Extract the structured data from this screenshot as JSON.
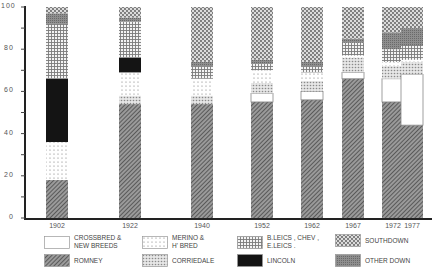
{
  "chart_data": {
    "type": "bar",
    "stacked": true,
    "title": "",
    "xlabel": "",
    "ylabel": "",
    "ylim": [
      0,
      100
    ],
    "yticks": [
      0,
      20,
      40,
      60,
      80,
      100
    ],
    "grid": false,
    "legend_position": "bottom",
    "categories": [
      "1902",
      "1922",
      "1940",
      "1952",
      "1962",
      "1967",
      "1972",
      "1977"
    ],
    "series": [
      {
        "name": "Romney",
        "pattern": "romney",
        "values": [
          18,
          54,
          54,
          55,
          56,
          66,
          55,
          44
        ]
      },
      {
        "name": "Crossbred & New Breeds",
        "pattern": "crossbred",
        "values": [
          0,
          0,
          0,
          4,
          4,
          3,
          11,
          24
        ]
      },
      {
        "name": "Corriedale",
        "pattern": "corriedale",
        "values": [
          0,
          4,
          4,
          5,
          5,
          7,
          6,
          6
        ]
      },
      {
        "name": "Merino & H' Bred",
        "pattern": "merino",
        "values": [
          18,
          11,
          8,
          6,
          4,
          1,
          2,
          1
        ]
      },
      {
        "name": "Lincoln",
        "pattern": "lincoln",
        "values": [
          30,
          7,
          0,
          0,
          0,
          0,
          0,
          0
        ]
      },
      {
        "name": "B.Leics, Chev, E.Leics.",
        "pattern": "leics",
        "values": [
          26,
          17,
          6,
          3,
          3,
          6,
          6,
          7
        ]
      },
      {
        "name": "Other Down",
        "pattern": "otherdown",
        "values": [
          5,
          2,
          2,
          2,
          2,
          2,
          8,
          8
        ]
      },
      {
        "name": "Southdown",
        "pattern": "southdown",
        "values": [
          3,
          5,
          26,
          25,
          26,
          15,
          12,
          10
        ]
      }
    ]
  },
  "axis": {
    "y_labels": [
      "0",
      "20",
      "40",
      "60",
      "80",
      "100"
    ],
    "x_labels": [
      "1902",
      "1922",
      "1940",
      "1952",
      "1962",
      "1967",
      "1972",
      "1977"
    ]
  },
  "legend": [
    {
      "label": "Crossbred &\nNew Breeds",
      "pattern": "crossbred"
    },
    {
      "label": "Merino &\nH' Bred",
      "pattern": "merino"
    },
    {
      "label": "B.Leics , Chev ,\nE.Leics .",
      "pattern": "leics"
    },
    {
      "label": "Southdown",
      "pattern": "southdown"
    },
    {
      "label": "Romney",
      "pattern": "romney"
    },
    {
      "label": "Corriedale",
      "pattern": "corriedale"
    },
    {
      "label": "Lincoln",
      "pattern": "lincoln"
    },
    {
      "label": "Other Down",
      "pattern": "otherdown"
    }
  ]
}
